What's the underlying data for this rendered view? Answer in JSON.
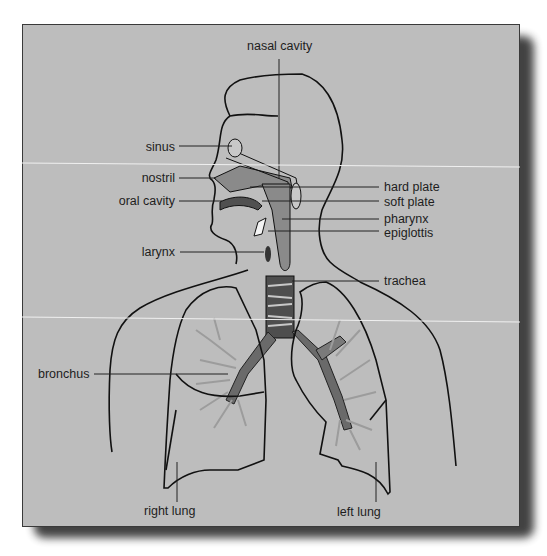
{
  "diagram": {
    "type": "anatomical-diagram",
    "background_color": "#bdbdbd",
    "line_color": "#111111",
    "accent_colors": {
      "airway_fill": "#8a8a8a",
      "cartilage_dark": "#4e4e4e",
      "bronchiole_light": "#9c9c9c"
    }
  },
  "labels": {
    "nasal_cavity": "nasal cavity",
    "sinus": "sinus",
    "nostril": "nostril",
    "oral_cavity": "oral cavity",
    "hard_plate": "hard plate",
    "soft_plate": "soft plate",
    "pharynx": "pharynx",
    "epiglottis": "epiglottis",
    "larynx": "larynx",
    "trachea": "trachea",
    "bronchus": "bronchus",
    "right_lung": "right lung",
    "left_lung": "left lung"
  }
}
